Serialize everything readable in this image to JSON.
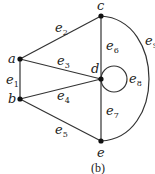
{
  "caption": "(b)",
  "nodes": {
    "a": {
      "label": "a",
      "x": 20,
      "y": 59
    },
    "b": {
      "label": "b",
      "x": 20,
      "y": 99
    },
    "c": {
      "label": "c",
      "x": 101,
      "y": 16
    },
    "d": {
      "label": "d",
      "x": 101,
      "y": 79
    },
    "e": {
      "label": "e",
      "x": 101,
      "y": 141
    }
  },
  "edges": {
    "e1": {
      "name": "e",
      "sub": "1",
      "from": "a",
      "to": "b"
    },
    "e2": {
      "name": "e",
      "sub": "2",
      "from": "a",
      "to": "c"
    },
    "e3": {
      "name": "e",
      "sub": "3",
      "from": "a",
      "to": "d"
    },
    "e4": {
      "name": "e",
      "sub": "4",
      "from": "b",
      "to": "d"
    },
    "e5": {
      "name": "e",
      "sub": "5",
      "from": "b",
      "to": "e"
    },
    "e6": {
      "name": "e",
      "sub": "6",
      "from": "c",
      "to": "d"
    },
    "e7": {
      "name": "e",
      "sub": "7",
      "from": "d",
      "to": "e"
    },
    "e8": {
      "name": "e",
      "sub": "8",
      "from": "d",
      "to": "d"
    },
    "e9": {
      "name": "e",
      "sub": "9",
      "from": "c",
      "to": "e"
    }
  }
}
